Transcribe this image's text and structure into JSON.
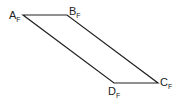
{
  "diagram": {
    "vertices": [
      {
        "id": "A",
        "label": "A",
        "sub": "F",
        "x": 23,
        "y": 15
      },
      {
        "id": "B",
        "label": "B",
        "sub": "F",
        "x": 67,
        "y": 15
      },
      {
        "id": "C",
        "label": "C",
        "sub": "F",
        "x": 158,
        "y": 83
      },
      {
        "id": "D",
        "label": "D",
        "sub": "F",
        "x": 114,
        "y": 83
      }
    ],
    "edges": [
      [
        "A",
        "B"
      ],
      [
        "B",
        "C"
      ],
      [
        "C",
        "D"
      ],
      [
        "D",
        "A"
      ]
    ],
    "stroke_color": "#222222"
  }
}
